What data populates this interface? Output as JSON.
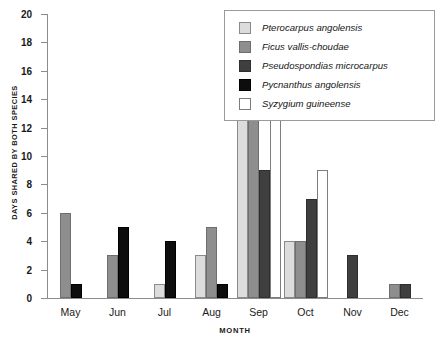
{
  "chart_data": {
    "type": "bar",
    "title": "",
    "xlabel": "MONTH",
    "ylabel": "DAYS SHARED BY BOTH SPECIES",
    "categories": [
      "May",
      "Jun",
      "Jul",
      "Aug",
      "Sep",
      "Oct",
      "Nov",
      "Dec"
    ],
    "ylim": [
      0,
      20
    ],
    "yticks": [
      0,
      2,
      4,
      6,
      8,
      10,
      12,
      14,
      16,
      18,
      20
    ],
    "grid": false,
    "legend_position": "top-right",
    "series": [
      {
        "name": "Pterocarpus angolensis",
        "color": "#dcdcdc",
        "edge": "#8a8a8a",
        "values": [
          0,
          0,
          1,
          3,
          15,
          4,
          0,
          0
        ]
      },
      {
        "name": "Ficus vallis-choudae",
        "color": "#8e8e8e",
        "edge": "#6e6e6e",
        "values": [
          6,
          3,
          0,
          5,
          16,
          4,
          0,
          1
        ]
      },
      {
        "name": "Pseudospondias microcarpus",
        "color": "#3f3f3f",
        "edge": "#2e2e2e",
        "values": [
          0,
          0,
          0,
          0,
          9,
          7,
          3,
          1
        ]
      },
      {
        "name": "Pycnanthus angolensis",
        "color": "#0d0d0d",
        "edge": "#000000",
        "values": [
          1,
          5,
          4,
          1,
          0,
          0,
          0,
          0
        ]
      },
      {
        "name": "Syzygium guineense",
        "color": "#ffffff",
        "edge": "#7d7d7d",
        "values": [
          0,
          0,
          0,
          0,
          14,
          9,
          0,
          0
        ]
      }
    ]
  }
}
